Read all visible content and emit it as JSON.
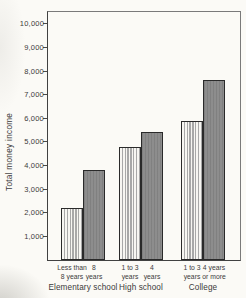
{
  "chart_data": {
    "type": "bar",
    "title": "",
    "xlabel": "",
    "ylabel": "Total money income",
    "ylim": [
      0,
      10500
    ],
    "grid": false,
    "legend": "none",
    "yticks": [
      {
        "value": 1000,
        "label": "1,000"
      },
      {
        "value": 2000,
        "label": "2,000"
      },
      {
        "value": 3000,
        "label": "3,000"
      },
      {
        "value": 4000,
        "label": "4,000"
      },
      {
        "value": 5000,
        "label": "5,000"
      },
      {
        "value": 6000,
        "label": "6,000"
      },
      {
        "value": 7000,
        "label": "7,000"
      },
      {
        "value": 8000,
        "label": "8,000"
      },
      {
        "value": 9000,
        "label": "9,000"
      },
      {
        "value": 10000,
        "label": "10,000"
      }
    ],
    "groups": [
      {
        "label": "Elementary school",
        "bars": [
          {
            "label_lines": [
              "Less than",
              "8 years"
            ],
            "value": 2200,
            "style": "striped"
          },
          {
            "label_lines": [
              "8",
              "years"
            ],
            "value": 3800,
            "style": "solid"
          }
        ]
      },
      {
        "label": "High school",
        "bars": [
          {
            "label_lines": [
              "1 to 3",
              "years"
            ],
            "value": 4800,
            "style": "striped"
          },
          {
            "label_lines": [
              "4",
              "years"
            ],
            "value": 5400,
            "style": "solid"
          }
        ]
      },
      {
        "label": "College",
        "bars": [
          {
            "label_lines": [
              "1 to 3",
              "years"
            ],
            "value": 5900,
            "style": "striped"
          },
          {
            "label_lines": [
              "4 years",
              "or more"
            ],
            "value": 7600,
            "style": "solid"
          }
        ]
      }
    ],
    "colors": {
      "paper": "#fbfaf6",
      "striped_bar_bg": "#f7f6f2",
      "striped_bar_stripe": "#a8a8a8",
      "solid_bar_fill": "#8d8d8d",
      "bar_border": "#2a2a2a",
      "axis": "#414141",
      "text": "#3b3b3b"
    }
  }
}
